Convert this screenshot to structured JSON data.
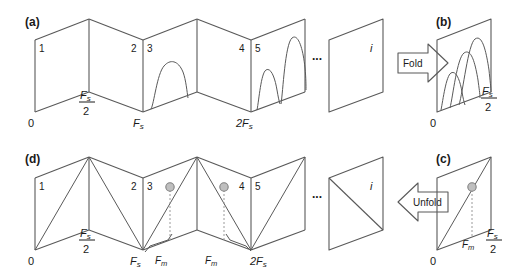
{
  "figure": {
    "background": "#ffffff",
    "stroke_color": "#595959",
    "text_color": "#1a1a1a",
    "marker_fill": "#bfbfbf",
    "marker_stroke": "#808080",
    "dash_color": "#9a9a9a"
  },
  "panels": {
    "a": {
      "tag": "(a)",
      "zone_labels": [
        "1",
        "2",
        "3",
        "4",
        "5"
      ],
      "ellipsis": "...",
      "last_zone_label": "i",
      "axis_labels": [
        {
          "text": "0",
          "value": "0"
        },
        {
          "text": "Fs/2",
          "num": "F",
          "sub": "s",
          "den": "2"
        },
        {
          "text": "Fs",
          "num": "F",
          "sub": "s"
        },
        {
          "text": "2Fs",
          "num": "2F",
          "sub": "s"
        }
      ],
      "curves_in_zones": [
        3,
        5
      ],
      "zone3_peaks": 1,
      "zone5_peaks": 2
    },
    "b": {
      "tag": "(b)",
      "axis_labels": [
        {
          "text": "0"
        },
        {
          "text": "Fs/2",
          "num": "F",
          "sub": "s",
          "den": "2"
        }
      ],
      "peak_count": 3,
      "peak_heights": [
        0.42,
        0.68,
        0.88
      ]
    },
    "c": {
      "tag": "(c)",
      "axis_labels": [
        {
          "text": "0"
        },
        {
          "text": "Fm",
          "num": "F",
          "sub": "m"
        },
        {
          "text": "Fs/2",
          "num": "F",
          "sub": "s",
          "den": "2"
        }
      ],
      "has_marker": true,
      "has_dashed_drop": true,
      "has_diagonal": true
    },
    "d": {
      "tag": "(d)",
      "zone_labels": [
        "1",
        "2",
        "3",
        "4",
        "5"
      ],
      "ellipsis": "...",
      "last_zone_label": "i",
      "axis_labels": [
        {
          "text": "0"
        },
        {
          "text": "Fs/2",
          "num": "F",
          "sub": "s",
          "den": "2"
        },
        {
          "text": "Fs",
          "num": "F",
          "sub": "s"
        },
        {
          "text": "2Fs",
          "num": "2F",
          "sub": "s"
        }
      ],
      "bracket_labels": [
        {
          "num": "F",
          "sub": "m"
        },
        {
          "num": "F",
          "sub": "m"
        }
      ],
      "marker_count": 2,
      "has_diagonals": true
    }
  },
  "arrows": {
    "fold": {
      "label": "Fold",
      "direction": "right"
    },
    "unfold": {
      "label": "Unfold",
      "direction": "left"
    }
  }
}
